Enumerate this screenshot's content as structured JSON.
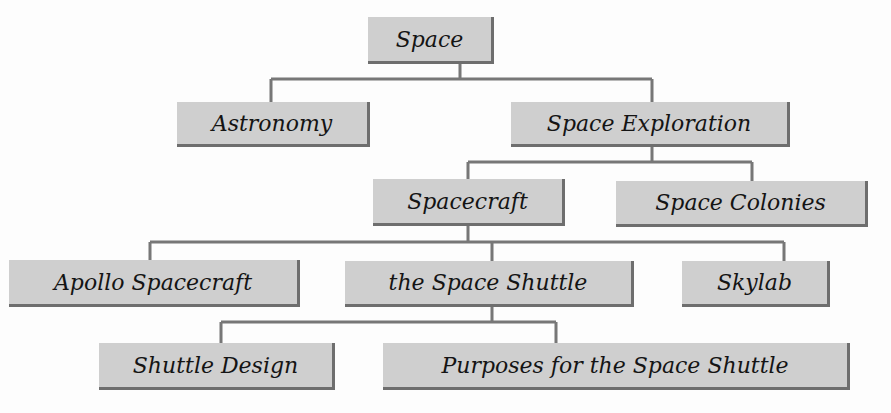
{
  "diagram": {
    "type": "hierarchy-tree",
    "colors": {
      "box_fill": "#cfcfcf",
      "box_shadow": "#6e6e6e",
      "line": "#777777",
      "text": "#141414",
      "background": "#fdfdfd"
    },
    "nodes": {
      "space": {
        "label": "Space",
        "x": 368,
        "y": 17,
        "w": 126,
        "h": 47
      },
      "astronomy": {
        "label": "Astronomy",
        "x": 177,
        "y": 102,
        "w": 193,
        "h": 45
      },
      "space_exploration": {
        "label": "Space Exploration",
        "x": 511,
        "y": 102,
        "w": 279,
        "h": 45
      },
      "spacecraft": {
        "label": "Spacecraft",
        "x": 373,
        "y": 179,
        "w": 192,
        "h": 47
      },
      "space_colonies": {
        "label": "Space Colonies",
        "x": 616,
        "y": 181,
        "w": 252,
        "h": 46
      },
      "apollo_spacecraft": {
        "label": "Apollo Spacecraft",
        "x": 9,
        "y": 260,
        "w": 291,
        "h": 47
      },
      "space_shuttle": {
        "label": "the Space Shuttle",
        "x": 345,
        "y": 261,
        "w": 289,
        "h": 46
      },
      "skylab": {
        "label": "Skylab",
        "x": 682,
        "y": 261,
        "w": 148,
        "h": 46
      },
      "shuttle_design": {
        "label": "Shuttle Design",
        "x": 99,
        "y": 343,
        "w": 236,
        "h": 47
      },
      "purposes": {
        "label": "Purposes for the Space Shuttle",
        "x": 383,
        "y": 343,
        "w": 467,
        "h": 47
      }
    },
    "edges": [
      {
        "from": "Space",
        "to": [
          "Astronomy",
          "Space Exploration"
        ]
      },
      {
        "from": "Space Exploration",
        "to": [
          "Spacecraft",
          "Space Colonies"
        ]
      },
      {
        "from": "Spacecraft",
        "to": [
          "Apollo Spacecraft",
          "the Space Shuttle",
          "Skylab"
        ]
      },
      {
        "from": "the Space Shuttle",
        "to": [
          "Shuttle Design",
          "Purposes for the Space Shuttle"
        ]
      }
    ]
  }
}
